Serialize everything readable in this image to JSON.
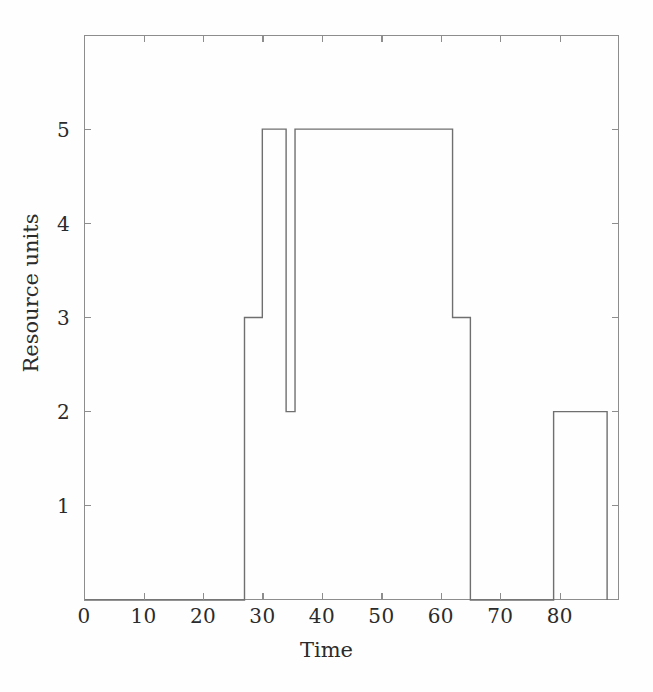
{
  "chart_data": {
    "type": "line",
    "subtype": "step-post",
    "title": "",
    "xlabel": "Time",
    "ylabel": "Resource units",
    "xlim": [
      0,
      90
    ],
    "ylim": [
      0,
      6
    ],
    "xticks": [
      0,
      10,
      20,
      30,
      40,
      50,
      60,
      70,
      80
    ],
    "yticks": [
      1,
      2,
      3,
      4,
      5
    ],
    "grid": false,
    "legend": null,
    "line_color": "#6f6f6f",
    "x": [
      0,
      27,
      30,
      34,
      35.5,
      62,
      65,
      79,
      88
    ],
    "y": [
      0,
      3,
      5,
      2,
      5,
      3,
      0,
      2,
      2
    ],
    "segments": [
      {
        "x_start": 0,
        "x_end": 27,
        "value": 0
      },
      {
        "x_start": 27,
        "x_end": 30,
        "value": 3
      },
      {
        "x_start": 30,
        "x_end": 34,
        "value": 5
      },
      {
        "x_start": 34,
        "x_end": 35.5,
        "value": 2
      },
      {
        "x_start": 35.5,
        "x_end": 62,
        "value": 5
      },
      {
        "x_start": 62,
        "x_end": 65,
        "value": 3
      },
      {
        "x_start": 65,
        "x_end": 79,
        "value": 0
      },
      {
        "x_start": 79,
        "x_end": 88,
        "value": 2
      }
    ]
  },
  "axes": {
    "x_title": "Time",
    "y_title": "Resource units",
    "x_tick_labels": [
      "0",
      "10",
      "20",
      "30",
      "40",
      "50",
      "60",
      "70",
      "80"
    ],
    "y_tick_labels": [
      "1",
      "2",
      "3",
      "4",
      "5"
    ]
  },
  "style": {
    "frame_color": "#8d8d8d",
    "text_color": "#2b2b2b",
    "background": "#fefefe"
  }
}
